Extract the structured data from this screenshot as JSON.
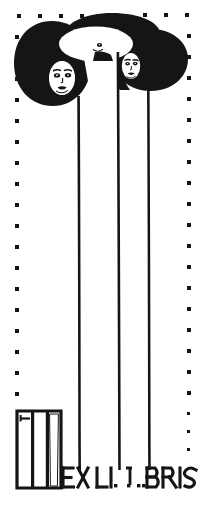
{
  "plate": {
    "kind": "bookplate",
    "title": "EX LIBRIS",
    "style": "Vienna Secession / Art Nouveau line print",
    "width": 205,
    "height": 510,
    "background_color": "#ffffff",
    "ink_color": "#151515"
  },
  "border": {
    "name": "dotted-border",
    "style": "square dots",
    "color": "#151515",
    "dot_size": 4,
    "top_y": 14,
    "left_x": 15,
    "right_x": 189,
    "left_bottom_y": 400,
    "right_bottom_y": 452,
    "spacing_top": 21,
    "spacing_side": 21
  },
  "figures": [
    {
      "name": "figure-left",
      "hair_shape": "filled-ellipse",
      "hair_cx": 52,
      "hair_cy": 63,
      "hair_rx": 38,
      "hair_ry": 42,
      "face_cx": 62,
      "face_cy": 77,
      "stem_x": 78,
      "stem_top": 98,
      "stem_bottom": 470
    },
    {
      "name": "figure-center",
      "hair_shape": "filled-ellipse-with-outline-halo",
      "hair_cx": 112,
      "hair_cy": 35,
      "hair_rx": 48,
      "hair_ry": 23,
      "halo_cx": 96,
      "halo_cy": 44,
      "halo_rx": 40,
      "halo_ry": 20,
      "face_cx": 99,
      "face_cy": 46,
      "gown_left": 79,
      "gown_right": 117,
      "gown_top": 52,
      "gown_bottom": 470
    },
    {
      "name": "figure-right",
      "hair_shape": "filled-ellipse",
      "hair_cx": 152,
      "hair_cy": 60,
      "hair_rx": 37,
      "hair_ry": 31,
      "face_cx": 131,
      "face_cy": 66,
      "stem_x": 148,
      "stem_top": 90,
      "stem_bottom": 470
    }
  ],
  "monogram": {
    "name": "book-stack-monogram",
    "description": "three upright books forming an M-like block",
    "x": 16,
    "y": 410,
    "width": 46,
    "height": 78,
    "book_count": 3
  },
  "lettering": {
    "name": "ex-libris-lettering",
    "full_text": "EX LIBRIS",
    "segments": [
      {
        "text": "EX LI",
        "x": 60,
        "baseline": 484
      },
      {
        "text": "BRIS",
        "x": 146,
        "baseline": 484
      }
    ],
    "punctuation_dots": [
      {
        "x": 104,
        "y": 481
      },
      {
        "x": 124,
        "y": 481
      },
      {
        "x": 136,
        "y": 481
      },
      {
        "x": 143,
        "y": 481
      }
    ],
    "baseline_y": 484,
    "cap_height": 22,
    "color": "#151515"
  }
}
